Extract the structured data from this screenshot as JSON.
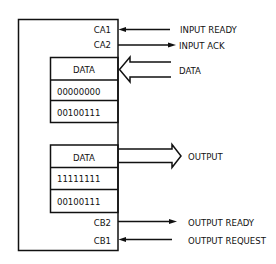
{
  "diagram": {
    "outer_box": {
      "port_a_labels": [
        "CA1",
        "CA2"
      ],
      "port_b_labels": [
        "CB2",
        "CB1"
      ]
    },
    "input_register": {
      "header": "DATA",
      "rows": [
        "00000000",
        "00100111"
      ]
    },
    "output_register": {
      "header": "DATA",
      "rows": [
        "11111111",
        "00100111"
      ]
    },
    "signals": {
      "ca1": "INPUT READY",
      "ca2": "INPUT ACK",
      "data_in": "DATA",
      "data_out": "OUTPUT",
      "cb2": "OUTPUT READY",
      "cb1": "OUTPUT REQUEST"
    },
    "colors": {
      "line": "#111111",
      "background": "#ffffff"
    }
  }
}
